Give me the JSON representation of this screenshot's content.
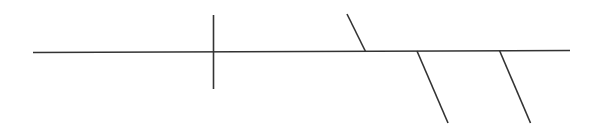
{
  "diagram": {
    "background": "#ffffff",
    "stroke_color": "#333333",
    "stroke_width": 1.6,
    "segments": [
      {
        "name": "main-horizontal-line",
        "x1": 33,
        "y1": 52.5,
        "x2": 570,
        "y2": 50.5
      },
      {
        "name": "vertical-cross-line",
        "x1": 213.5,
        "y1": 15,
        "x2": 213.5,
        "y2": 89
      },
      {
        "name": "upper-slanted-branch",
        "x1": 347,
        "y1": 14,
        "x2": 365.5,
        "y2": 51.5
      },
      {
        "name": "lower-slanted-branch-1",
        "x1": 417,
        "y1": 51,
        "x2": 448,
        "y2": 123
      },
      {
        "name": "lower-slanted-branch-2",
        "x1": 499.5,
        "y1": 50.5,
        "x2": 530.5,
        "y2": 123
      }
    ]
  }
}
